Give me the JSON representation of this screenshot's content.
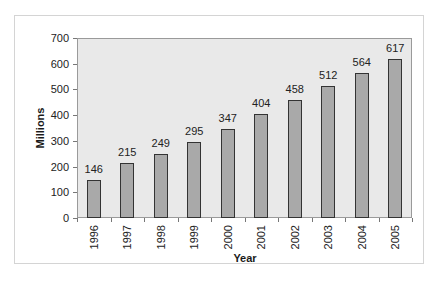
{
  "chart_data": {
    "type": "bar",
    "title": "",
    "xlabel": "Year",
    "ylabel": "Millions",
    "categories": [
      "1996",
      "1997",
      "1998",
      "1999",
      "2000",
      "2001",
      "2002",
      "2003",
      "2004",
      "2005"
    ],
    "values": [
      146,
      215,
      249,
      295,
      347,
      404,
      458,
      512,
      564,
      617
    ],
    "data_labels": [
      "146",
      "215",
      "249",
      "295",
      "347",
      "404",
      "458",
      "512",
      "564",
      "617"
    ],
    "ylim": [
      0,
      700
    ],
    "yticks": [
      "0",
      "100",
      "200",
      "300",
      "400",
      "500",
      "600",
      "700"
    ],
    "grid": false,
    "legend": "none",
    "colors": {
      "bar_fill": "#a9a9a9",
      "bar_edge": "#333333",
      "plot_bg": "#e9e9e9",
      "frame_bg": "#ffffff"
    }
  }
}
